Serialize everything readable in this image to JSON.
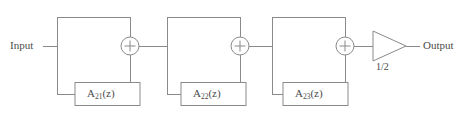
{
  "diagram": {
    "type": "signal-flow-block-diagram",
    "line_color": "#8a8a8a",
    "text_color": "#4a4a4a",
    "background_color": "#ffffff",
    "input": {
      "label": "Input"
    },
    "output": {
      "label": "Output"
    },
    "gain": {
      "label": "1/2",
      "value": 0.5,
      "shape": "triangle-amplifier"
    },
    "stages": [
      {
        "index": 1,
        "block_label_base": "A",
        "block_label_subscript": "21",
        "block_label_suffix": "(z)",
        "block_label_full": "A21(z)",
        "adder_symbol": "+"
      },
      {
        "index": 2,
        "block_label_base": "A",
        "block_label_subscript": "22",
        "block_label_suffix": "(z)",
        "block_label_full": "A22(z)",
        "adder_symbol": "+"
      },
      {
        "index": 3,
        "block_label_base": "A",
        "block_label_subscript": "23",
        "block_label_suffix": "(z)",
        "block_label_full": "A23(z)",
        "adder_symbol": "+"
      }
    ]
  }
}
